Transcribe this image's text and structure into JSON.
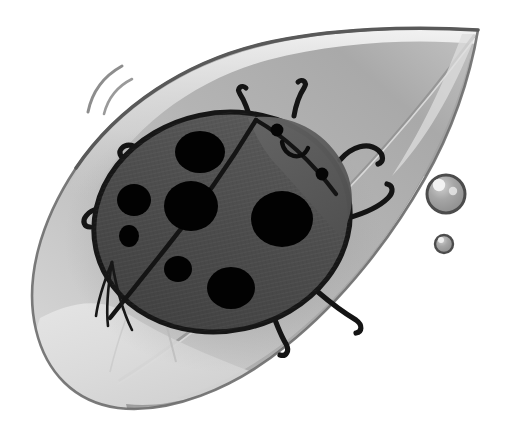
{
  "artwork": {
    "title": "Ladybug resting on a leaf",
    "medium": "grayscale watercolor and ink illustration",
    "canvas_width": 520,
    "canvas_height": 439,
    "background_color": "#ffffff"
  },
  "palette": {
    "paper_white": "#ffffff",
    "leaf_highlight": "#e2e2e2",
    "leaf_light": "#cfcfcf",
    "leaf_mid": "#b4b4b4",
    "leaf_shadow": "#a0a0a0",
    "leaf_deep_shadow": "#8e8e8e",
    "leaf_outline": "#6f6f6f",
    "leaf_edge_dark": "#5e5e5e",
    "body_shell": "#4a4a4a",
    "body_shell_light": "#585858",
    "body_head": "#5c5c5c",
    "body_outline": "#1a1a1a",
    "spot_black": "#000000",
    "droplet_fill": "#9c9c9c",
    "droplet_rim": "#4f4f4f",
    "droplet_highlight": "#f2f2f2",
    "motion_line": "#8a8a8a"
  },
  "leaf": {
    "name": "leaf",
    "shape": "broad pointed ovate leaf angled from lower-left to upper-right",
    "tip_direction": "upper-right",
    "tip_position": {
      "x": 478,
      "y": 30
    },
    "has_light_rim": true,
    "rim_color": "#eeeeee",
    "fold_present": true,
    "fold_description": "pale folded lower-left lobe with a crease line",
    "vein_present": true,
    "vein_description": "long central vein running from the tip toward the lower left"
  },
  "ladybug": {
    "name": "ladybug",
    "center": {
      "x": 222,
      "y": 222
    },
    "body_width": 258,
    "body_height": 218,
    "rotation_deg": -12,
    "shell_color": "#4a4a4a",
    "outline_color": "#1a1a1a",
    "outline_width": 4,
    "elytra_seam": {
      "present": true,
      "description": "diagonal seam dividing the two wing covers, running from upper-right head area down to lower-left"
    },
    "secondary_wing_lines": {
      "present": true,
      "count": 3,
      "description": "short converging crease lines on the lower-left wing cover"
    },
    "head": {
      "name": "head",
      "color": "#5c5c5c",
      "position": {
        "x": 300,
        "y": 150
      },
      "eyes": [
        {
          "label": "left-eye",
          "x": 277,
          "y": 130,
          "r": 6
        },
        {
          "label": "right-eye",
          "x": 322,
          "y": 173,
          "r": 6
        }
      ],
      "mouth": {
        "label": "smile",
        "shape": "downward open arc",
        "center": {
          "x": 294,
          "y": 148
        },
        "radius": 13
      }
    },
    "antennae": [
      {
        "label": "left-antenna",
        "start": {
          "x": 248,
          "y": 118
        },
        "tip": {
          "x": 243,
          "y": 90
        }
      },
      {
        "label": "right-antenna",
        "start": {
          "x": 296,
          "y": 112
        },
        "tip": {
          "x": 303,
          "y": 88
        }
      }
    ],
    "legs": [
      {
        "label": "front-left-leg",
        "side": "left",
        "start": {
          "x": 140,
          "y": 155
        },
        "tip": {
          "x": 128,
          "y": 148
        }
      },
      {
        "label": "middle-left-leg",
        "side": "left",
        "start": {
          "x": 108,
          "y": 212
        },
        "tip": {
          "x": 86,
          "y": 218
        }
      },
      {
        "label": "front-right-leg",
        "side": "right",
        "start": {
          "x": 345,
          "y": 168
        },
        "tip": {
          "x": 378,
          "y": 154
        }
      },
      {
        "label": "middle-right-leg",
        "side": "right",
        "start": {
          "x": 355,
          "y": 216
        },
        "tip": {
          "x": 393,
          "y": 200
        }
      },
      {
        "label": "rear-left-leg",
        "side": "bottom",
        "start": {
          "x": 272,
          "y": 300
        },
        "tip": {
          "x": 286,
          "y": 352
        }
      },
      {
        "label": "rear-right-leg",
        "side": "bottom",
        "start": {
          "x": 322,
          "y": 290
        },
        "tip": {
          "x": 357,
          "y": 322
        }
      }
    ],
    "spots": [
      {
        "label": "spot-upper-left",
        "x": 200,
        "y": 152,
        "rx": 24,
        "ry": 20
      },
      {
        "label": "spot-left-small",
        "x": 134,
        "y": 200,
        "rx": 16,
        "ry": 15
      },
      {
        "label": "spot-left-tiny",
        "x": 128,
        "y": 234,
        "rx": 9,
        "ry": 10
      },
      {
        "label": "spot-center",
        "x": 190,
        "y": 205,
        "rx": 26,
        "ry": 24
      },
      {
        "label": "spot-right-large",
        "x": 281,
        "y": 218,
        "rx": 30,
        "ry": 27
      },
      {
        "label": "spot-lower-small",
        "x": 178,
        "y": 268,
        "rx": 13,
        "ry": 13
      },
      {
        "label": "spot-lower-large",
        "x": 231,
        "y": 287,
        "rx": 23,
        "ry": 20
      }
    ],
    "spot_count": 7
  },
  "water_droplets": [
    {
      "label": "large-droplet",
      "x": 446,
      "y": 194,
      "r": 19,
      "fill": "#9c9c9c",
      "rim": "#4f4f4f",
      "highlights": [
        {
          "x": 440,
          "y": 185,
          "r": 6
        },
        {
          "x": 453,
          "y": 190,
          "r": 4
        }
      ]
    },
    {
      "label": "small-droplet",
      "x": 444,
      "y": 244,
      "r": 9,
      "fill": "#9c9c9c",
      "rim": "#4f4f4f",
      "highlights": [
        {
          "x": 441,
          "y": 240,
          "r": 3
        }
      ]
    }
  ],
  "motion_lines": {
    "name": "motion-lines",
    "count": 2,
    "position": {
      "x": 88,
      "y": 72
    },
    "color": "#8a8a8a",
    "description": "two short curved speed marks at the upper left suggesting movement"
  }
}
